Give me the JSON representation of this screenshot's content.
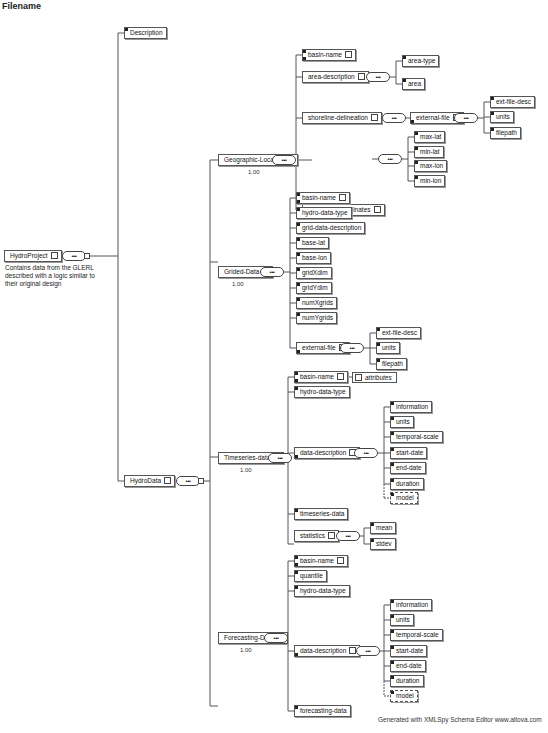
{
  "page_title": "Filename",
  "root": {
    "label": "HydroProject",
    "description": "Contains data from the GLERL described with a logic similar to their original design"
  },
  "top_children": {
    "description": "Description",
    "hydrodata": "HydroData"
  },
  "groups": [
    {
      "label": "Geographic-Location",
      "cardinality": "1.00",
      "children": [
        {
          "label": "basin-name",
          "expandable": true
        },
        {
          "label": "area-description",
          "children": [
            "area-type",
            "area"
          ]
        },
        {
          "label": "shoreline-delineation",
          "children": [
            {
              "label": "external-file",
              "children": [
                "ext-file-desc",
                "units",
                "filepath"
              ]
            }
          ]
        },
        {
          "label": "bounding-coordinates",
          "children": [
            "max-lat",
            "min-lat",
            "max-lon",
            "min-lon"
          ]
        }
      ]
    },
    {
      "label": "Grided-Data",
      "cardinality": "1.00",
      "children": [
        {
          "label": "basin-name",
          "expandable": true
        },
        {
          "label": "hydro-data-type"
        },
        {
          "label": "grid-data-description"
        },
        {
          "label": "base-lat"
        },
        {
          "label": "base-lon"
        },
        {
          "label": "gridXdim"
        },
        {
          "label": "gridYdim"
        },
        {
          "label": "numXgrids"
        },
        {
          "label": "numYgrids"
        },
        {
          "label": "external-file",
          "children": [
            "ext-file-desc",
            "units",
            "filepath"
          ]
        }
      ]
    },
    {
      "label": "Timeseries-data",
      "cardinality": "1.00",
      "children": [
        {
          "label": "basin-name",
          "attributes_label": "attributes"
        },
        {
          "label": "hydro-data-type"
        },
        {
          "label": "data-description",
          "children": [
            "information",
            "units",
            "temporal-scale",
            "start-date",
            "end-date",
            "duration"
          ],
          "optional_child": "model"
        },
        {
          "label": "timeseries-data"
        },
        {
          "label": "statistics",
          "children": [
            "mean",
            "stdev"
          ]
        }
      ]
    },
    {
      "label": "Forecasting-Data",
      "cardinality": "1.00",
      "children": [
        {
          "label": "basin-name",
          "expandable": true
        },
        {
          "label": "quantile"
        },
        {
          "label": "hydro-data-type"
        },
        {
          "label": "data-description",
          "children": [
            "information",
            "units",
            "temporal-scale",
            "start-date",
            "end-date",
            "duration"
          ],
          "optional_child": "model"
        },
        {
          "label": "forecasting-data"
        }
      ]
    }
  ],
  "sequence_symbol": "•••",
  "footer": "Generated with XMLSpy Schema Editor www.altova.com"
}
